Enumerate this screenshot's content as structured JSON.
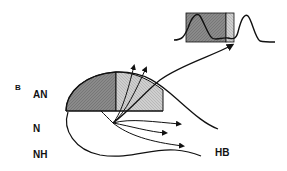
{
  "figure": {
    "panel_label": "B",
    "region_labels": {
      "an": "AN",
      "n": "N",
      "nh": "NH",
      "hb": "HB"
    },
    "colors": {
      "dark_region": "#8a8a8a",
      "light_region": "#c4c4c4",
      "inset_dark": "#8f8f8f",
      "inset_light": "#c8c8c8",
      "line": "#111111"
    },
    "elements": {
      "dome": "half-dome divided into dark (left) and light (right) hatched regions",
      "upward_arrows": 3,
      "downward_arrows": 3,
      "long_arrow": "curved arrow from dome to inset waveform",
      "inset": "waveform with two peaks; shaded box over left peak and trough"
    }
  }
}
